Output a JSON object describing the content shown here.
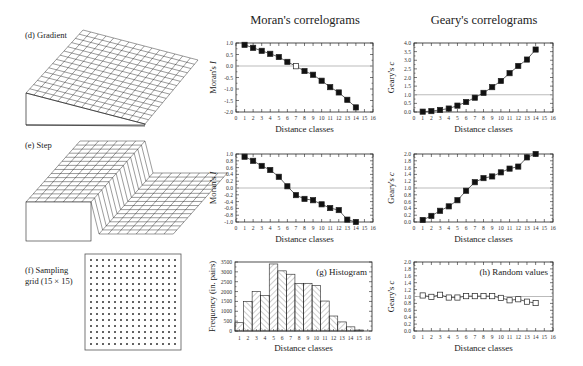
{
  "figure": {
    "column_titles": {
      "moran": "Moran's correlograms",
      "geary": "Geary's correlograms"
    },
    "panel_labels": {
      "d": "(d) Gradient",
      "e": "(e) Step",
      "f_line1": "(f) Sampling",
      "f_line2": "grid (15 × 15)",
      "g": "(g) Histogram",
      "h": "(h) Random values"
    },
    "sampling_grid": {
      "rows": 15,
      "cols": 15
    },
    "colors": {
      "ink": "#222222",
      "reference_line": "#aaaaaa",
      "hatch": "#555555",
      "marker_filled": "#111111",
      "marker_open": "#ffffff"
    }
  },
  "chart_data": [
    {
      "id": "moran-gradient",
      "type": "line",
      "title": "",
      "xlabel": "Distance classes",
      "ylabel": "Moran's I",
      "xlim": [
        0,
        16
      ],
      "ylim": [
        -2.0,
        1.0
      ],
      "xticks": [
        "0",
        "1",
        "2",
        "3",
        "4",
        "5",
        "6",
        "7",
        "8",
        "9",
        "10",
        "11",
        "12",
        "13",
        "14",
        "15",
        "16"
      ],
      "yticks": [
        "1.0",
        "0.5",
        "0.0",
        "-0.5",
        "-1.0",
        "-1.5",
        "-2.0"
      ],
      "reference_y": 0.0,
      "grid": false,
      "series": [
        {
          "name": "Moran's I",
          "x": [
            1,
            2,
            3,
            4,
            5,
            6,
            7,
            8,
            9,
            10,
            11,
            12,
            13,
            14
          ],
          "y": [
            0.92,
            0.79,
            0.66,
            0.53,
            0.39,
            0.18,
            -0.01,
            -0.22,
            -0.38,
            -0.64,
            -0.92,
            -1.15,
            -1.47,
            -1.8
          ],
          "open": [
            false,
            false,
            false,
            false,
            false,
            false,
            true,
            false,
            false,
            false,
            false,
            false,
            false,
            false
          ]
        }
      ]
    },
    {
      "id": "geary-gradient",
      "type": "line",
      "title": "",
      "xlabel": "Distance classes",
      "ylabel": "Geary's c",
      "xlim": [
        0,
        16
      ],
      "ylim": [
        0.0,
        4.0
      ],
      "xticks": [
        "0",
        "1",
        "2",
        "3",
        "4",
        "5",
        "6",
        "7",
        "8",
        "9",
        "10",
        "11",
        "12",
        "13",
        "14",
        "15",
        "16"
      ],
      "yticks": [
        "4.0",
        "3.5",
        "3.0",
        "2.5",
        "2.0",
        "1.5",
        "1.0",
        "0.5",
        "0.0"
      ],
      "reference_y": 1.0,
      "grid": false,
      "series": [
        {
          "name": "Geary's c",
          "x": [
            1,
            2,
            3,
            4,
            5,
            6,
            7,
            8,
            9,
            10,
            11,
            12,
            13,
            14
          ],
          "y": [
            0.02,
            0.05,
            0.12,
            0.2,
            0.37,
            0.58,
            0.83,
            1.11,
            1.44,
            1.8,
            2.25,
            2.67,
            3.04,
            3.62
          ],
          "open": [
            false,
            false,
            false,
            false,
            false,
            false,
            false,
            false,
            false,
            false,
            false,
            false,
            false,
            false
          ]
        }
      ]
    },
    {
      "id": "moran-step",
      "type": "line",
      "title": "",
      "xlabel": "Distance classes",
      "ylabel": "Moran's I",
      "xlim": [
        0,
        16
      ],
      "ylim": [
        -1.0,
        1.0
      ],
      "xticks": [
        "0",
        "1",
        "2",
        "3",
        "4",
        "5",
        "6",
        "7",
        "8",
        "9",
        "10",
        "11",
        "12",
        "13",
        "14",
        "15",
        "16"
      ],
      "yticks": [
        "1.0",
        "0.8",
        "0.6",
        "0.4",
        "0.2",
        "0.0",
        "-0.2",
        "-0.4",
        "-0.6",
        "-0.8",
        "-1.0"
      ],
      "reference_y": 0.0,
      "grid": false,
      "series": [
        {
          "name": "Moran's I",
          "x": [
            1,
            2,
            3,
            4,
            5,
            6,
            7,
            8,
            9,
            10,
            11,
            12,
            13,
            14
          ],
          "y": [
            0.92,
            0.8,
            0.65,
            0.53,
            0.33,
            0.05,
            -0.21,
            -0.32,
            -0.36,
            -0.48,
            -0.59,
            -0.65,
            -0.93,
            -1.0
          ],
          "open": [
            false,
            false,
            false,
            false,
            false,
            false,
            false,
            false,
            false,
            false,
            false,
            false,
            false,
            false
          ]
        }
      ]
    },
    {
      "id": "geary-step",
      "type": "line",
      "title": "",
      "xlabel": "Distance classes",
      "ylabel": "Geary's c",
      "xlim": [
        0,
        16
      ],
      "ylim": [
        0.0,
        2.0
      ],
      "xticks": [
        "0",
        "1",
        "2",
        "3",
        "4",
        "5",
        "6",
        "7",
        "8",
        "9",
        "10",
        "11",
        "12",
        "13",
        "14",
        "15",
        "16"
      ],
      "yticks": [
        "2.0",
        "1.8",
        "1.6",
        "1.4",
        "1.2",
        "1.0",
        "0.8",
        "0.6",
        "0.4",
        "0.2",
        "0.0"
      ],
      "reference_y": 1.0,
      "grid": false,
      "series": [
        {
          "name": "Geary's c",
          "x": [
            1,
            2,
            3,
            4,
            5,
            6,
            7,
            8,
            9,
            10,
            11,
            12,
            13,
            14
          ],
          "y": [
            0.06,
            0.18,
            0.33,
            0.46,
            0.64,
            0.92,
            1.17,
            1.29,
            1.34,
            1.46,
            1.57,
            1.63,
            1.9,
            2.0
          ],
          "open": [
            false,
            false,
            false,
            false,
            false,
            false,
            false,
            false,
            false,
            false,
            false,
            false,
            false,
            false
          ]
        }
      ]
    },
    {
      "id": "histogram",
      "type": "bar",
      "title": "(g) Histogram",
      "xlabel": "Distance classes",
      "ylabel": "Frequency (in. pairs)",
      "ylim": [
        0,
        3500
      ],
      "categories": [
        "1",
        "2",
        "3",
        "4",
        "5",
        "6",
        "7",
        "8",
        "9",
        "10",
        "11",
        "12",
        "13",
        "14",
        "15",
        "16"
      ],
      "values": [
        420,
        1500,
        2000,
        1800,
        3400,
        3050,
        2880,
        2400,
        2420,
        2300,
        1520,
        760,
        460,
        210,
        50,
        0
      ],
      "yticks": [
        "3500",
        "3000",
        "2500",
        "2000",
        "1500",
        "1000",
        "500",
        "0"
      ],
      "grid": false
    },
    {
      "id": "geary-random",
      "type": "line",
      "title": "(h) Random values",
      "xlabel": "Distance classes",
      "ylabel": "Geary's c",
      "xlim": [
        0,
        16
      ],
      "ylim": [
        0.0,
        2.0
      ],
      "xticks": [
        "0",
        "1",
        "2",
        "3",
        "4",
        "5",
        "6",
        "7",
        "8",
        "9",
        "10",
        "11",
        "12",
        "13",
        "14",
        "15",
        "16"
      ],
      "yticks": [
        "2.0",
        "1.8",
        "1.6",
        "1.4",
        "1.2",
        "1.0",
        "0.8",
        "0.6",
        "0.4",
        "0.2",
        "0.0"
      ],
      "reference_y": 1.0,
      "grid": false,
      "series": [
        {
          "name": "Geary's c",
          "x": [
            1,
            2,
            3,
            4,
            5,
            6,
            7,
            8,
            9,
            10,
            11,
            12,
            13,
            14
          ],
          "y": [
            1.03,
            0.99,
            1.05,
            0.97,
            0.97,
            1.01,
            1.01,
            1.01,
            1.01,
            0.96,
            0.89,
            0.92,
            0.85,
            0.81
          ],
          "open": [
            true,
            true,
            true,
            true,
            true,
            true,
            true,
            true,
            true,
            true,
            true,
            true,
            true,
            true
          ]
        }
      ]
    }
  ]
}
